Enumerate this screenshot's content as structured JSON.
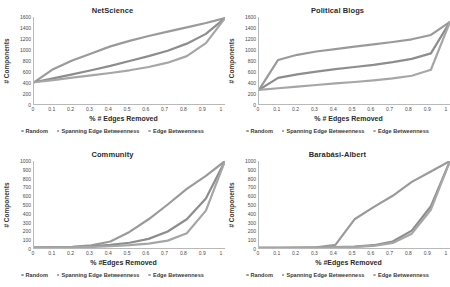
{
  "figure": {
    "panel_count": 4,
    "series_names": [
      "Random",
      "Spanning Edge Betweenness",
      "Edge Betweenness"
    ],
    "series_colors": [
      "#9a9a9a",
      "#8d8d8d",
      "#a6a6a6"
    ]
  },
  "legend": {
    "items": [
      {
        "label": "Random",
        "color": "#9e9e9e",
        "marker": "dot-marker"
      },
      {
        "label": "Spanning Edge Betweenness",
        "color": "#8d8d8d",
        "marker": "dot-marker"
      },
      {
        "label": "Edge Betweenness",
        "color": "#a8a8a8",
        "marker": "dot-marker"
      }
    ]
  },
  "chart_data": [
    {
      "type": "line",
      "title": "NetScience",
      "xlabel": "% # Edges Removed",
      "ylabel": "# Components",
      "xlim": [
        0,
        1
      ],
      "ylim": [
        0,
        1600
      ],
      "xticks": [
        "0",
        "0.1",
        "0.2",
        "0.3",
        "0.4",
        "0.5",
        "0.6",
        "0.7",
        "0.8",
        "0.9",
        "1"
      ],
      "yticks": [
        "0",
        "200",
        "400",
        "600",
        "800",
        "1000",
        "1200",
        "1400",
        "1600"
      ],
      "grid": false,
      "legend_position": "bottom",
      "x": [
        0,
        0.1,
        0.2,
        0.3,
        0.4,
        0.5,
        0.6,
        0.7,
        0.8,
        0.9,
        1.0
      ],
      "series": [
        {
          "name": "Random",
          "values": [
            400,
            640,
            800,
            930,
            1060,
            1160,
            1250,
            1330,
            1410,
            1490,
            1580
          ]
        },
        {
          "name": "Spanning Edge Betweenness",
          "values": [
            400,
            470,
            545,
            620,
            700,
            790,
            880,
            980,
            1110,
            1290,
            1580
          ]
        },
        {
          "name": "Edge Betweenness",
          "values": [
            400,
            440,
            485,
            525,
            570,
            620,
            680,
            760,
            880,
            1120,
            1580
          ]
        }
      ]
    },
    {
      "type": "line",
      "title": "Political Blogs",
      "xlabel": "% # Edges Removed",
      "ylabel": "# Components",
      "xlim": [
        0,
        1
      ],
      "ylim": [
        0,
        1600
      ],
      "xticks": [
        "0",
        "0.1",
        "0.2",
        "0.3",
        "0.4",
        "0.5",
        "0.6",
        "0.7",
        "0.8",
        "0.9",
        "1"
      ],
      "yticks": [
        "0",
        "200",
        "400",
        "600",
        "800",
        "1000",
        "1200",
        "1400",
        "1600"
      ],
      "grid": false,
      "legend_position": "bottom",
      "x": [
        0,
        0.1,
        0.2,
        0.3,
        0.4,
        0.5,
        0.6,
        0.7,
        0.8,
        0.9,
        1.0
      ],
      "series": [
        {
          "name": "Random",
          "values": [
            260,
            810,
            905,
            965,
            1010,
            1055,
            1095,
            1140,
            1190,
            1270,
            1510
          ]
        },
        {
          "name": "Spanning Edge Betweenness",
          "values": [
            260,
            480,
            545,
            595,
            640,
            680,
            720,
            770,
            830,
            930,
            1510
          ]
        },
        {
          "name": "Edge Betweenness",
          "values": [
            260,
            290,
            320,
            350,
            380,
            405,
            435,
            470,
            520,
            630,
            1510
          ]
        }
      ]
    },
    {
      "type": "line",
      "title": "Community",
      "xlabel": "% #Edges Removed",
      "ylabel": "# Components",
      "xlim": [
        0,
        1
      ],
      "ylim": [
        0,
        1000
      ],
      "xticks": [
        "0",
        "0.1",
        "0.2",
        "0.3",
        "0.4",
        "0.5",
        "0.6",
        "0.7",
        "0.8",
        "0.9",
        "1"
      ],
      "yticks": [
        "0",
        "100",
        "200",
        "300",
        "400",
        "500",
        "600",
        "700",
        "800",
        "900",
        "1000"
      ],
      "grid": false,
      "legend_position": "bottom",
      "x": [
        0,
        0.1,
        0.2,
        0.3,
        0.4,
        0.5,
        0.6,
        0.7,
        0.8,
        0.9,
        1.0
      ],
      "series": [
        {
          "name": "Random",
          "values": [
            5,
            8,
            14,
            30,
            75,
            185,
            330,
            500,
            680,
            830,
            1000
          ]
        },
        {
          "name": "Spanning Edge Betweenness",
          "values": [
            5,
            7,
            10,
            18,
            35,
            60,
            105,
            190,
            330,
            570,
            1000
          ]
        },
        {
          "name": "Edge Betweenness",
          "values": [
            5,
            6,
            8,
            12,
            20,
            32,
            50,
            85,
            170,
            430,
            1000
          ]
        }
      ]
    },
    {
      "type": "line",
      "title": "Barabási-Albert",
      "xlabel": "% #Edges Removed",
      "ylabel": "# Components",
      "xlim": [
        0,
        1
      ],
      "ylim": [
        0,
        1000
      ],
      "xticks": [
        "0",
        "0.1",
        "0.2",
        "0.3",
        "0.4",
        "0.5",
        "0.6",
        "0.7",
        "0.8",
        "0.9",
        "1"
      ],
      "yticks": [
        "0",
        "100",
        "200",
        "300",
        "400",
        "500",
        "600",
        "700",
        "800",
        "900",
        "1000"
      ],
      "grid": false,
      "legend_position": "bottom",
      "x": [
        0,
        0.1,
        0.2,
        0.3,
        0.4,
        0.5,
        0.6,
        0.7,
        0.8,
        0.9,
        1.0
      ],
      "series": [
        {
          "name": "Random",
          "values": [
            2,
            3,
            5,
            8,
            35,
            330,
            470,
            600,
            760,
            880,
            1000
          ]
        },
        {
          "name": "Spanning Edge Betweenness",
          "values": [
            2,
            2,
            3,
            5,
            9,
            16,
            32,
            75,
            200,
            480,
            1000
          ]
        },
        {
          "name": "Edge Betweenness",
          "values": [
            2,
            2,
            3,
            4,
            7,
            12,
            24,
            58,
            165,
            440,
            1000
          ]
        }
      ]
    }
  ]
}
